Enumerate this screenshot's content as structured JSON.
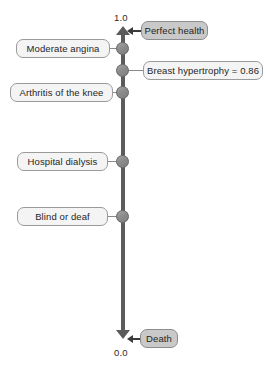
{
  "diagram": {
    "type": "vertical-utility-scale",
    "axis": {
      "name": "utility-axis",
      "top_value": "1.0",
      "bottom_value": "0.0",
      "top_anchor_label": "Perfect health",
      "bottom_anchor_label": "Death",
      "line_color": "#5b5b5b"
    },
    "anchors": [
      {
        "name": "perfect-health",
        "label": "Perfect health",
        "value": "1.0",
        "side": "right",
        "style": "shaded"
      },
      {
        "name": "death",
        "label": "Death",
        "value": "0.0",
        "side": "right",
        "style": "shaded"
      }
    ],
    "nodes": [
      {
        "name": "moderate-angina",
        "label": "Moderate angina",
        "side": "left"
      },
      {
        "name": "breast-hypertrophy",
        "label": "Breast hypertrophy = 0.86",
        "value": "0.86",
        "side": "right"
      },
      {
        "name": "arthritis-of-the-knee",
        "label": "Arthritis of the knee",
        "side": "left"
      },
      {
        "name": "hospital-dialysis",
        "label": "Hospital dialysis",
        "side": "left"
      },
      {
        "name": "blind-or-deaf",
        "label": "Blind or deaf",
        "side": "left"
      }
    ],
    "colors": {
      "axis": "#5b5b5b",
      "node_marker": "#8f8f8f",
      "box_fill": "#f4f4f4",
      "box_fill_shaded": "#c9c9c9",
      "box_border": "#9a9a9a",
      "text": "#1f1f1f",
      "background": "#ffffff"
    }
  }
}
